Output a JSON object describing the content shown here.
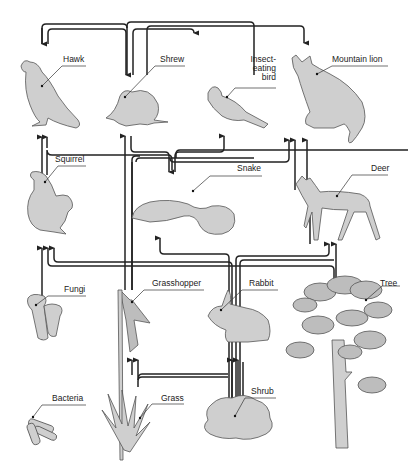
{
  "diagram": {
    "type": "food-web",
    "organisms": [
      {
        "id": "hawk",
        "label": "Hawk"
      },
      {
        "id": "shrew",
        "label": "Shrew"
      },
      {
        "id": "bird",
        "label_lines": [
          "Insect-",
          "eating",
          "bird"
        ]
      },
      {
        "id": "lion",
        "label": "Mountain lion"
      },
      {
        "id": "squirrel",
        "label": "Squirrel"
      },
      {
        "id": "snake",
        "label": "Snake"
      },
      {
        "id": "deer",
        "label": "Deer"
      },
      {
        "id": "fungi",
        "label": "Fungi"
      },
      {
        "id": "grasshopper",
        "label": "Grasshopper"
      },
      {
        "id": "rabbit",
        "label": "Rabbit"
      },
      {
        "id": "tree",
        "label": "Tree"
      },
      {
        "id": "bacteria",
        "label": "Bacteria"
      },
      {
        "id": "grass",
        "label": "Grass"
      },
      {
        "id": "shrub",
        "label": "Shrub"
      }
    ],
    "edges": [
      {
        "from": "shrew",
        "to": "hawk"
      },
      {
        "from": "bird",
        "to": "hawk"
      },
      {
        "from": "shrew",
        "to": "lion"
      },
      {
        "from": "squirrel",
        "to": "hawk"
      },
      {
        "from": "snake",
        "to": "hawk"
      },
      {
        "from": "grasshopper",
        "to": "shrew"
      },
      {
        "from": "grasshopper",
        "to": "bird"
      },
      {
        "from": "snake",
        "to": "lion"
      },
      {
        "from": "deer",
        "to": "lion"
      },
      {
        "from": "rabbit",
        "to": "lion"
      },
      {
        "from": "shrew",
        "to": "snake"
      },
      {
        "from": "squirrel",
        "to": "snake"
      },
      {
        "from": "rabbit",
        "to": "snake"
      },
      {
        "from": "tree",
        "to": "squirrel"
      },
      {
        "from": "fungi",
        "to": "squirrel"
      },
      {
        "from": "shrub",
        "to": "squirrel"
      },
      {
        "from": "tree",
        "to": "deer"
      },
      {
        "from": "shrub",
        "to": "deer"
      },
      {
        "from": "grass",
        "to": "grasshopper"
      },
      {
        "from": "shrub",
        "to": "grasshopper"
      },
      {
        "from": "grass",
        "to": "rabbit"
      },
      {
        "from": "shrub",
        "to": "rabbit"
      }
    ]
  }
}
